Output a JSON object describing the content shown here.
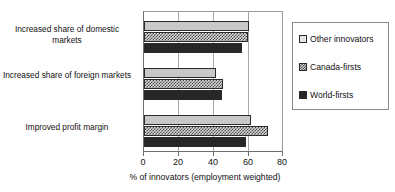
{
  "chart_data": {
    "type": "bar",
    "orientation": "horizontal",
    "title": "",
    "xlabel": "% of innovators (employment weighted)",
    "ylabel": "",
    "xlim": [
      0,
      80
    ],
    "xticks": [
      0,
      20,
      40,
      60,
      80
    ],
    "grid": true,
    "legend_position": "right",
    "categories": [
      "Increased share of domestic markets",
      "Increased share of foreign markets",
      "Improved profit margin"
    ],
    "series": [
      {
        "name": "Other innovators",
        "color": "#c8c8c8",
        "values": [
          61,
          42,
          62
        ]
      },
      {
        "name": "Canada-firsts",
        "color": "#d8d8d8",
        "values": [
          60,
          46,
          72
        ]
      },
      {
        "name": "World-firsts",
        "color": "#272727",
        "values": [
          57,
          45,
          59
        ]
      }
    ]
  },
  "axis": {
    "tick_labels": [
      "0",
      "20",
      "40",
      "60",
      "80"
    ],
    "x_title": "% of innovators (employment weighted)"
  },
  "legend": {
    "entries": [
      {
        "label": "Other innovators"
      },
      {
        "label": "Canada-firsts"
      },
      {
        "label": "World-firsts"
      }
    ]
  },
  "categories": {
    "labels": [
      "Increased share of domestic markets",
      "Increased share of foreign markets",
      "Improved profit margin"
    ]
  }
}
